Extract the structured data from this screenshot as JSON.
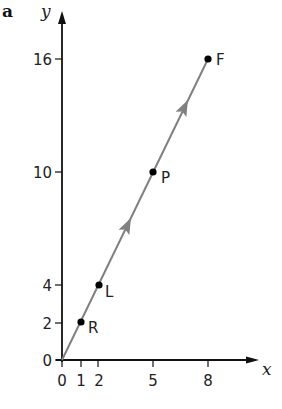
{
  "figure": {
    "panel_label": "a",
    "x_axis_label": "x",
    "y_axis_label": "y",
    "x_ticks": [
      "0",
      "1",
      "2",
      "5",
      "8"
    ],
    "y_ticks": [
      "0",
      "2",
      "4",
      "10",
      "16"
    ],
    "points": [
      {
        "label": "R",
        "x": 1,
        "y": 2
      },
      {
        "label": "L",
        "x": 2,
        "y": 4
      },
      {
        "label": "P",
        "x": 5,
        "y": 10
      },
      {
        "label": "F",
        "x": 8,
        "y": 16
      }
    ],
    "line": {
      "from": [
        0,
        0
      ],
      "to": [
        8,
        16
      ],
      "color": "#808080",
      "direction_arrows": 2
    },
    "axis_color": "#111111"
  }
}
